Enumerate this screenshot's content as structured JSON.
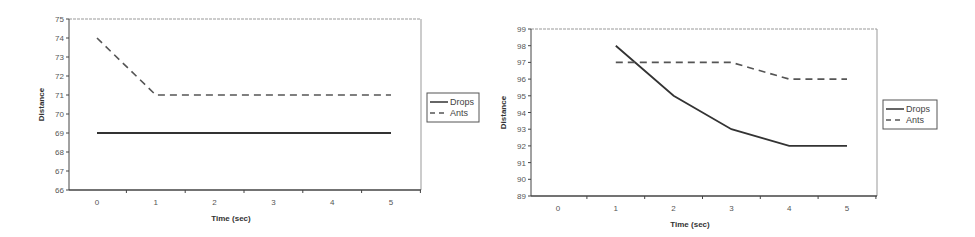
{
  "chart_data": [
    {
      "type": "line",
      "title": "",
      "xlabel": "Time (sec)",
      "ylabel": "Distance",
      "x": [
        0,
        1,
        2,
        3,
        4,
        5
      ],
      "ylim": [
        66,
        75
      ],
      "yticks": [
        66,
        67,
        68,
        69,
        70,
        71,
        72,
        73,
        74,
        75
      ],
      "xticks": [
        0,
        1,
        2,
        3,
        4,
        5
      ],
      "grid": false,
      "legend_position": "right",
      "series": [
        {
          "name": "Drops",
          "style": "solid",
          "values": [
            69,
            69,
            69,
            69,
            69,
            69
          ]
        },
        {
          "name": "Ants",
          "style": "dashed",
          "values": [
            74,
            71,
            71,
            71,
            71,
            71
          ]
        }
      ]
    },
    {
      "type": "line",
      "title": "",
      "xlabel": "Time (sec)",
      "ylabel": "Distance",
      "x": [
        0,
        1,
        2,
        3,
        4,
        5
      ],
      "ylim": [
        89,
        99
      ],
      "yticks": [
        89,
        90,
        91,
        92,
        93,
        94,
        95,
        96,
        97,
        98,
        99
      ],
      "xticks": [
        0,
        1,
        2,
        3,
        4,
        5
      ],
      "grid": false,
      "legend_position": "right",
      "series": [
        {
          "name": "Drops",
          "style": "solid",
          "values": [
            null,
            98,
            95,
            93,
            92,
            92
          ]
        },
        {
          "name": "Ants",
          "style": "dashed",
          "values": [
            null,
            97,
            97,
            97,
            96,
            96
          ]
        }
      ]
    }
  ],
  "colors": {
    "line": "#333333",
    "dashed": "#555555",
    "axis": "#444444",
    "frame": "#999999"
  }
}
